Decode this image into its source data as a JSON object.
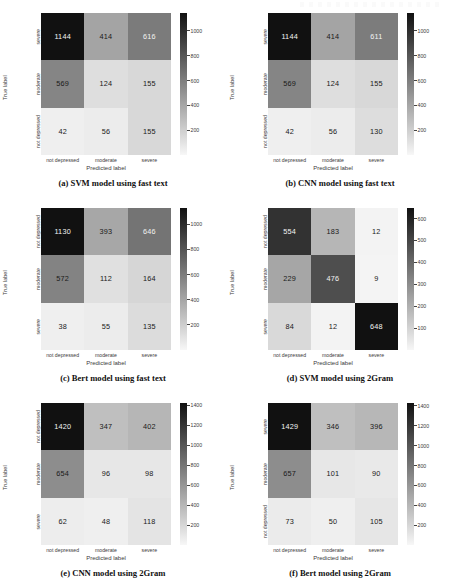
{
  "figure": {
    "axis_titles": {
      "y": "True label",
      "x": "Predicted label"
    },
    "class_labels": [
      "not depressed",
      "moderate",
      "severe"
    ]
  },
  "chart_data": [
    {
      "type": "heatmap",
      "panel_id": "a",
      "title": "(a)  SVM model using fast text",
      "xlabel": "Predicted label",
      "ylabel": "True label",
      "x_ticklabels": [
        "not depressed",
        "moderate",
        "severe"
      ],
      "y_ticklabels": [
        "severe",
        "moderate",
        "not depressed"
      ],
      "values": [
        [
          1144,
          414,
          616
        ],
        [
          569,
          124,
          155
        ],
        [
          42,
          56,
          155
        ]
      ],
      "colorbar_ticks": [
        200,
        400,
        600,
        800,
        1000
      ],
      "vmin": 42,
      "vmax": 1144,
      "colormap": "Greys",
      "legend": "colorbar-right"
    },
    {
      "type": "heatmap",
      "panel_id": "b",
      "title": "(b)  CNN model using fast text",
      "xlabel": "Predicted label",
      "ylabel": "True label",
      "x_ticklabels": [
        "not depressed",
        "moderate",
        "severe"
      ],
      "y_ticklabels": [
        "severe",
        "moderate",
        "not depressed"
      ],
      "values": [
        [
          1144,
          414,
          611
        ],
        [
          569,
          124,
          155
        ],
        [
          42,
          56,
          130
        ]
      ],
      "colorbar_ticks": [
        200,
        400,
        600,
        800,
        1000
      ],
      "vmin": 42,
      "vmax": 1144,
      "colormap": "Greys",
      "legend": "colorbar-right"
    },
    {
      "type": "heatmap",
      "panel_id": "c",
      "title": "(c)  Bert model using fast text",
      "xlabel": "Predicted label",
      "ylabel": "True label",
      "x_ticklabels": [
        "not depressed",
        "moderate",
        "severe"
      ],
      "y_ticklabels": [
        "not depressed",
        "moderate",
        "severe"
      ],
      "values": [
        [
          1130,
          393,
          646
        ],
        [
          572,
          112,
          164
        ],
        [
          38,
          55,
          135
        ]
      ],
      "colorbar_ticks": [
        200,
        400,
        600,
        800,
        1000
      ],
      "vmin": 38,
      "vmax": 1130,
      "colormap": "Greys",
      "legend": "colorbar-right"
    },
    {
      "type": "heatmap",
      "panel_id": "d",
      "title": "(d)  SVM model using 2Gram",
      "xlabel": "Predicted label",
      "ylabel": "True label",
      "x_ticklabels": [
        "not depressed",
        "moderate",
        "severe"
      ],
      "y_ticklabels": [
        "not depressed",
        "moderate",
        "severe"
      ],
      "values": [
        [
          554,
          183,
          12
        ],
        [
          229,
          476,
          9
        ],
        [
          84,
          12,
          648
        ]
      ],
      "colorbar_ticks": [
        100,
        200,
        300,
        400,
        500,
        600
      ],
      "vmin": 9,
      "vmax": 648,
      "colormap": "Greys",
      "legend": "colorbar-right"
    },
    {
      "type": "heatmap",
      "panel_id": "e",
      "title": "(e)  CNN model using 2Gram",
      "xlabel": "Predicted label",
      "ylabel": "True label",
      "x_ticklabels": [
        "not depressed",
        "moderate",
        "severe"
      ],
      "y_ticklabels": [
        "not depressed",
        "moderate",
        "severe"
      ],
      "values": [
        [
          1420,
          347,
          402
        ],
        [
          654,
          96,
          98
        ],
        [
          62,
          48,
          118
        ]
      ],
      "colorbar_ticks": [
        200,
        400,
        600,
        800,
        1000,
        1200,
        1400
      ],
      "vmin": 48,
      "vmax": 1420,
      "colormap": "Greys",
      "legend": "colorbar-right"
    },
    {
      "type": "heatmap",
      "panel_id": "f",
      "title": "(f)  Bert model using 2Gram",
      "xlabel": "Predicted label",
      "ylabel": "True label",
      "x_ticklabels": [
        "not depressed",
        "moderate",
        "severe"
      ],
      "y_ticklabels": [
        "severe",
        "moderate",
        "not depressed"
      ],
      "values": [
        [
          1429,
          346,
          396
        ],
        [
          657,
          101,
          90
        ],
        [
          73,
          50,
          105
        ]
      ],
      "colorbar_ticks": [
        200,
        400,
        600,
        800,
        1000,
        1200,
        1400
      ],
      "vmin": 50,
      "vmax": 1429,
      "colormap": "Greys",
      "legend": "colorbar-right"
    }
  ]
}
